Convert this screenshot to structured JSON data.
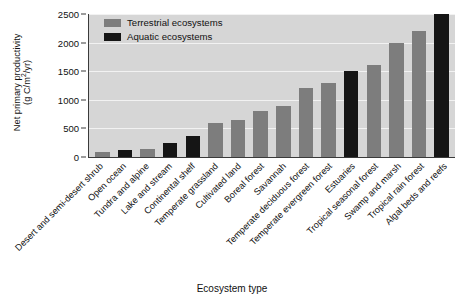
{
  "chart_data": {
    "type": "bar",
    "title": "",
    "xlabel": "Ecosystem type",
    "ylabel_line1": "Net primary productivity",
    "ylabel_line2": "(g C/m2/yr)",
    "ylabel": "Net primary productivity (g C/m2/yr)",
    "ylim": [
      0,
      2500
    ],
    "yticks": [
      0,
      500,
      1000,
      1500,
      2000,
      2500
    ],
    "ytick_labels": [
      "0",
      "500",
      "1000",
      "1500",
      "2000",
      "2500"
    ],
    "grid": true,
    "legend_position": "top-left-inside",
    "categories": [
      "Desert and semi-desert shrub",
      "Open ocean",
      "Tundra and alpine",
      "Lake and stream",
      "Continental shelf",
      "Temperate grassland",
      "Cultivated land",
      "Boreal forest",
      "Savannah",
      "Temperate deciduous forest",
      "Temperate evergreen forest",
      "Estuaries",
      "Tropical seasonal forest",
      "Swamp and marsh",
      "Tropical rain forest",
      "Algal beds and reefs"
    ],
    "values": [
      90,
      125,
      140,
      250,
      360,
      600,
      650,
      800,
      900,
      1200,
      1300,
      1500,
      1600,
      2000,
      2200,
      2500
    ],
    "groups": [
      "terrestrial",
      "aquatic",
      "terrestrial",
      "aquatic",
      "aquatic",
      "terrestrial",
      "terrestrial",
      "terrestrial",
      "terrestrial",
      "terrestrial",
      "terrestrial",
      "aquatic",
      "terrestrial",
      "terrestrial",
      "terrestrial",
      "aquatic"
    ],
    "legend": [
      {
        "label": "Terrestrial ecosystems",
        "key": "terrestrial",
        "color": "#7d7d7d"
      },
      {
        "label": "Aquatic ecosystems",
        "key": "aquatic",
        "color": "#151515"
      }
    ],
    "colors": {
      "terrestrial": "#7d7d7d",
      "aquatic": "#151515",
      "plot_background": "#d6d6d6",
      "gridline": "#f2f2f2",
      "axis": "#3a3a3a",
      "text": "#111111"
    }
  }
}
